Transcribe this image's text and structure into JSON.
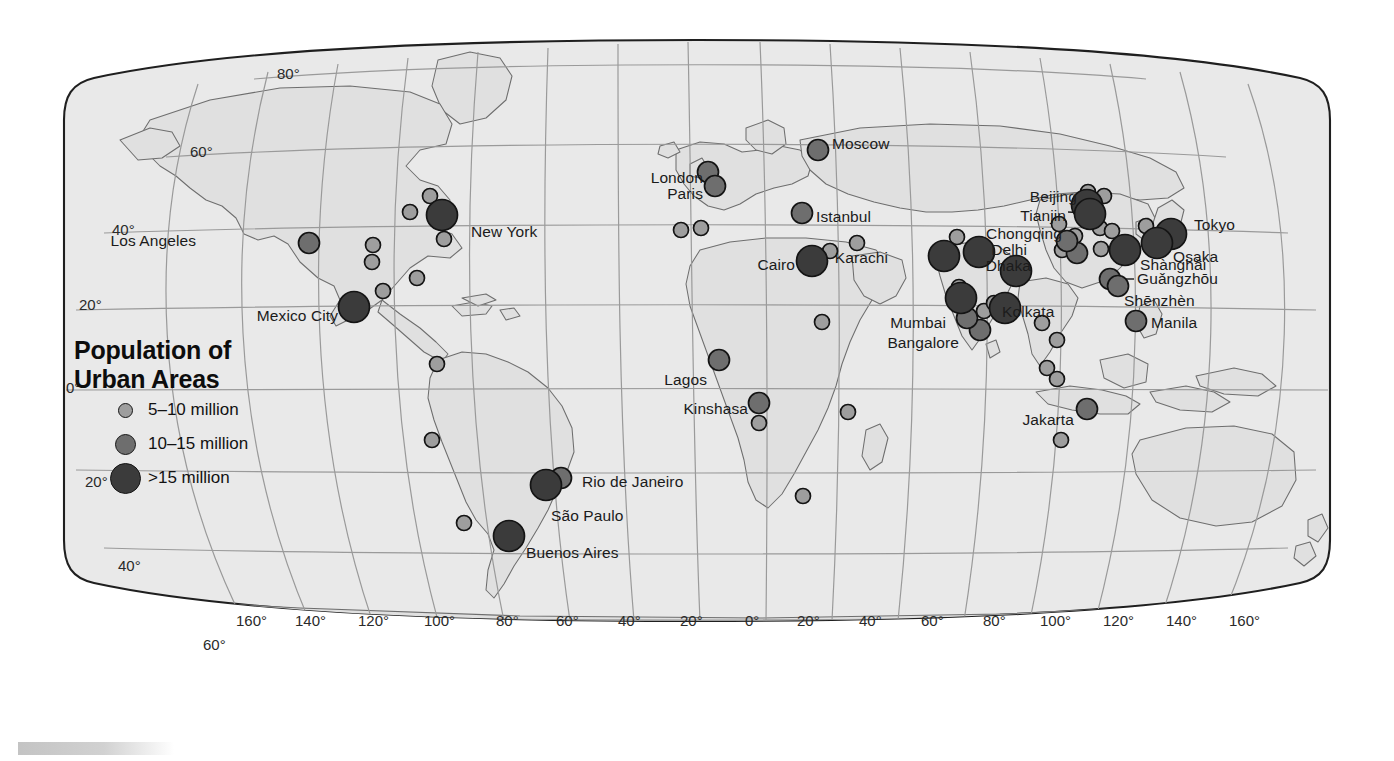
{
  "map": {
    "projection": "robinson",
    "ocean_color": "#ffffff",
    "land_color": "#e3e3e3",
    "land_border_color": "#6e6e6e",
    "outline_color": "#1f1f1f",
    "graticule_color": "#9a9a9a",
    "background_color": "#ffffff"
  },
  "legend": {
    "title_line1": "Population of",
    "title_line2": "Urban Areas",
    "classes": [
      {
        "label": "5–10 million",
        "color": "#9e9e9e",
        "radius": 7.5
      },
      {
        "label": "10–15 million",
        "color": "#6e6e6e",
        "radius": 10.5
      },
      {
        "label": ">15 million",
        "color": "#3b3b3b",
        "radius": 15.5
      }
    ]
  },
  "graticule_labels": {
    "latitude": [
      {
        "text": "80°",
        "x": 277,
        "y": 74
      },
      {
        "text": "60°",
        "x": 190,
        "y": 152
      },
      {
        "text": "40°",
        "x": 112,
        "y": 230
      },
      {
        "text": "20°",
        "x": 79,
        "y": 305
      },
      {
        "text": "0°",
        "x": 66,
        "y": 388
      },
      {
        "text": "20°",
        "x": 85,
        "y": 482
      },
      {
        "text": "40°",
        "x": 118,
        "y": 566
      },
      {
        "text": "60°",
        "x": 203,
        "y": 645
      }
    ],
    "longitude": [
      {
        "text": "160°",
        "x": 236,
        "y": 621
      },
      {
        "text": "140°",
        "x": 295,
        "y": 621
      },
      {
        "text": "120°",
        "x": 358,
        "y": 621
      },
      {
        "text": "100°",
        "x": 424,
        "y": 621
      },
      {
        "text": "80°",
        "x": 496,
        "y": 621
      },
      {
        "text": "60°",
        "x": 556,
        "y": 621
      },
      {
        "text": "40°",
        "x": 618,
        "y": 621
      },
      {
        "text": "20°",
        "x": 680,
        "y": 621
      },
      {
        "text": "0°",
        "x": 745,
        "y": 621
      },
      {
        "text": "20°",
        "x": 797,
        "y": 621
      },
      {
        "text": "40°",
        "x": 859,
        "y": 621
      },
      {
        "text": "60°",
        "x": 921,
        "y": 621
      },
      {
        "text": "80°",
        "x": 983,
        "y": 621
      },
      {
        "text": "100°",
        "x": 1040,
        "y": 621
      },
      {
        "text": "120°",
        "x": 1103,
        "y": 621
      },
      {
        "text": "140°",
        "x": 1166,
        "y": 621
      },
      {
        "text": "160°",
        "x": 1229,
        "y": 621
      }
    ]
  },
  "chart_data": {
    "type": "scatter",
    "title": "Population of Urban Areas",
    "size_classes": [
      {
        "name": "5–10 million",
        "color": "#9e9e9e",
        "radius_px": 7.5
      },
      {
        "name": "10–15 million",
        "color": "#6e6e6e",
        "radius_px": 10.5
      },
      {
        "name": ">15 million",
        "color": "#3b3b3b",
        "radius_px": 15.5
      }
    ],
    "labeled_cities": [
      {
        "name": "Los Angeles",
        "cls": 1,
        "cx": 309,
        "cy": 243,
        "lx": 196,
        "ly": 241,
        "anchor": "end"
      },
      {
        "name": "New York",
        "cls": 2,
        "cx": 442,
        "cy": 215,
        "lx": 471,
        "ly": 232,
        "anchor": "start"
      },
      {
        "name": "Mexico City",
        "cls": 2,
        "cx": 354,
        "cy": 307,
        "lx": 338,
        "ly": 316,
        "anchor": "end"
      },
      {
        "name": "Rio de Janeiro",
        "cls": 1,
        "cx": 561,
        "cy": 478,
        "lx": 582,
        "ly": 482,
        "anchor": "start"
      },
      {
        "name": "São Paulo",
        "cls": 2,
        "cx": 546,
        "cy": 485,
        "lx": 551,
        "ly": 516,
        "anchor": "start"
      },
      {
        "name": "Buenos Aires",
        "cls": 2,
        "cx": 509,
        "cy": 536,
        "lx": 526,
        "ly": 553,
        "anchor": "start"
      },
      {
        "name": "London",
        "cls": 1,
        "cx": 708,
        "cy": 172,
        "lx": 703,
        "ly": 178,
        "anchor": "end"
      },
      {
        "name": "Paris",
        "cls": 1,
        "cx": 715,
        "cy": 186,
        "lx": 703,
        "ly": 194,
        "anchor": "end"
      },
      {
        "name": "Moscow",
        "cls": 1,
        "cx": 818,
        "cy": 150,
        "lx": 832,
        "ly": 144,
        "anchor": "start"
      },
      {
        "name": "Istanbul",
        "cls": 1,
        "cx": 802,
        "cy": 213,
        "lx": 816,
        "ly": 217,
        "anchor": "start"
      },
      {
        "name": "Cairo",
        "cls": 2,
        "cx": 812,
        "cy": 261,
        "lx": 795,
        "ly": 265,
        "anchor": "end"
      },
      {
        "name": "Karachi",
        "cls": 2,
        "cx": 944,
        "cy": 256,
        "lx": 888,
        "ly": 258,
        "anchor": "end"
      },
      {
        "name": "Lagos",
        "cls": 1,
        "cx": 719,
        "cy": 360,
        "lx": 707,
        "ly": 380,
        "anchor": "end"
      },
      {
        "name": "Kinshasa",
        "cls": 1,
        "cx": 759,
        "cy": 403,
        "lx": 748,
        "ly": 409,
        "anchor": "end"
      },
      {
        "name": "Delhi",
        "cls": 2,
        "cx": 979,
        "cy": 252,
        "lx": 1027,
        "ly": 250,
        "anchor": "end"
      },
      {
        "name": "Dhaka",
        "cls": 2,
        "cx": 1016,
        "cy": 271,
        "lx": 1031,
        "ly": 266,
        "anchor": "end"
      },
      {
        "name": "Mumbai",
        "cls": 2,
        "cx": 961,
        "cy": 298,
        "lx": 946,
        "ly": 323,
        "anchor": "end"
      },
      {
        "name": "Bangalore",
        "cls": 1,
        "cx": 967,
        "cy": 318,
        "lx": 959,
        "ly": 343,
        "anchor": "end"
      },
      {
        "name": "Kolkata",
        "cls": 2,
        "cx": 1005,
        "cy": 308,
        "lx": 1002,
        "ly": 312,
        "anchor": "start"
      },
      {
        "name": "Beijing",
        "cls": 2,
        "cx": 1087,
        "cy": 205,
        "lx": 1077,
        "ly": 197,
        "anchor": "end"
      },
      {
        "name": "Tianjin",
        "cls": 2,
        "cx": 1090,
        "cy": 214,
        "lx": 1066,
        "ly": 216,
        "anchor": "end"
      },
      {
        "name": "Chongqing",
        "cls": 1,
        "cx": 1067,
        "cy": 241,
        "lx": 1062,
        "ly": 234,
        "anchor": "end"
      },
      {
        "name": "Shànghǎi",
        "cls": 2,
        "cx": 1125,
        "cy": 250,
        "lx": 1140,
        "ly": 265,
        "anchor": "start"
      },
      {
        "name": "Guǎngzhōu",
        "cls": 1,
        "cx": 1110,
        "cy": 279,
        "lx": 1137,
        "ly": 279,
        "anchor": "start"
      },
      {
        "name": "Shēnzhèn",
        "cls": 1,
        "cx": 1118,
        "cy": 286,
        "lx": 1124,
        "ly": 301,
        "anchor": "start"
      },
      {
        "name": "Tokyo",
        "cls": 2,
        "cx": 1171,
        "cy": 234,
        "lx": 1194,
        "ly": 225,
        "anchor": "start"
      },
      {
        "name": "Osaka",
        "cls": 2,
        "cx": 1157,
        "cy": 243,
        "lx": 1173,
        "ly": 257,
        "anchor": "start"
      },
      {
        "name": "Manila",
        "cls": 1,
        "cx": 1136,
        "cy": 321,
        "lx": 1151,
        "ly": 323,
        "anchor": "start"
      },
      {
        "name": "Jakarta",
        "cls": 1,
        "cx": 1087,
        "cy": 409,
        "lx": 1074,
        "ly": 420,
        "anchor": "end"
      }
    ],
    "unlabeled_cities": [
      {
        "cls": 0,
        "cx": 410,
        "cy": 212
      },
      {
        "cls": 0,
        "cx": 444,
        "cy": 239
      },
      {
        "cls": 0,
        "cx": 373,
        "cy": 245
      },
      {
        "cls": 0,
        "cx": 372,
        "cy": 262
      },
      {
        "cls": 0,
        "cx": 430,
        "cy": 196
      },
      {
        "cls": 0,
        "cx": 417,
        "cy": 278
      },
      {
        "cls": 0,
        "cx": 383,
        "cy": 291
      },
      {
        "cls": 0,
        "cx": 437,
        "cy": 364
      },
      {
        "cls": 0,
        "cx": 432,
        "cy": 440
      },
      {
        "cls": 0,
        "cx": 464,
        "cy": 523
      },
      {
        "cls": 0,
        "cx": 681,
        "cy": 230
      },
      {
        "cls": 0,
        "cx": 701,
        "cy": 228
      },
      {
        "cls": 0,
        "cx": 857,
        "cy": 243
      },
      {
        "cls": 0,
        "cx": 830,
        "cy": 251
      },
      {
        "cls": 0,
        "cx": 822,
        "cy": 322
      },
      {
        "cls": 0,
        "cx": 759,
        "cy": 423
      },
      {
        "cls": 0,
        "cx": 848,
        "cy": 412
      },
      {
        "cls": 0,
        "cx": 803,
        "cy": 496
      },
      {
        "cls": 0,
        "cx": 957,
        "cy": 237
      },
      {
        "cls": 0,
        "cx": 959,
        "cy": 287
      },
      {
        "cls": 0,
        "cx": 984,
        "cy": 311
      },
      {
        "cls": 1,
        "cx": 980,
        "cy": 330
      },
      {
        "cls": 0,
        "cx": 994,
        "cy": 303
      },
      {
        "cls": 0,
        "cx": 1059,
        "cy": 224
      },
      {
        "cls": 0,
        "cx": 1088,
        "cy": 192
      },
      {
        "cls": 0,
        "cx": 1104,
        "cy": 196
      },
      {
        "cls": 0,
        "cx": 1100,
        "cy": 228
      },
      {
        "cls": 0,
        "cx": 1075,
        "cy": 236
      },
      {
        "cls": 1,
        "cx": 1077,
        "cy": 253
      },
      {
        "cls": 0,
        "cx": 1062,
        "cy": 250
      },
      {
        "cls": 0,
        "cx": 1101,
        "cy": 249
      },
      {
        "cls": 0,
        "cx": 1112,
        "cy": 231
      },
      {
        "cls": 0,
        "cx": 1146,
        "cy": 226
      },
      {
        "cls": 0,
        "cx": 1042,
        "cy": 323
      },
      {
        "cls": 0,
        "cx": 1057,
        "cy": 340
      },
      {
        "cls": 0,
        "cx": 1047,
        "cy": 368
      },
      {
        "cls": 0,
        "cx": 1057,
        "cy": 379
      },
      {
        "cls": 0,
        "cx": 1061,
        "cy": 440
      }
    ]
  }
}
